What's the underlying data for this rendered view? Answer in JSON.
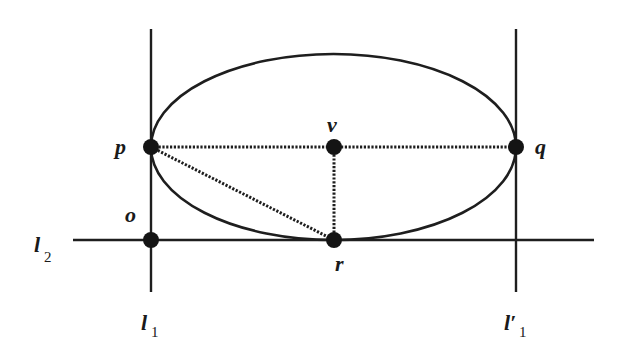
{
  "diagram": {
    "type": "geometry",
    "colors": {
      "stroke": "#1e1e1e",
      "point_fill": "#141414",
      "background": "#ffffff"
    },
    "lines": [
      {
        "id": "l1",
        "label": "l",
        "subscript": "1",
        "prime": "",
        "style": "solid",
        "x1": 151,
        "y1": 29,
        "x2": 151,
        "y2": 292
      },
      {
        "id": "l1prime",
        "label": "l",
        "subscript": "1",
        "prime": "′",
        "style": "solid",
        "x1": 516,
        "y1": 29,
        "x2": 516,
        "y2": 292
      },
      {
        "id": "l2",
        "label": "l",
        "subscript": "2",
        "prime": "",
        "style": "solid",
        "x1": 73,
        "y1": 240,
        "x2": 594,
        "y2": 240
      }
    ],
    "ellipse": {
      "cx": 333.5,
      "cy": 147,
      "rx": 182.5,
      "ry": 93
    },
    "dotted_segments": [
      {
        "from": "p",
        "to": "q"
      },
      {
        "from": "v",
        "to": "r"
      },
      {
        "from": "p",
        "to": "r"
      }
    ],
    "points": [
      {
        "id": "p",
        "label": "p",
        "x": 151,
        "y": 147
      },
      {
        "id": "v",
        "label": "v",
        "x": 334,
        "y": 147
      },
      {
        "id": "q",
        "label": "q",
        "x": 516,
        "y": 147
      },
      {
        "id": "o",
        "label": "o",
        "x": 151,
        "y": 240
      },
      {
        "id": "r",
        "label": "r",
        "x": 334,
        "y": 240
      }
    ],
    "labels": {
      "p": "p",
      "v": "v",
      "q": "q",
      "o": "o",
      "r": "r",
      "l2_main": "l",
      "l2_sub": "2",
      "l1_main": "l",
      "l1_sub": "1",
      "l1prime_main": "l′",
      "l1prime_sub": "1"
    }
  }
}
